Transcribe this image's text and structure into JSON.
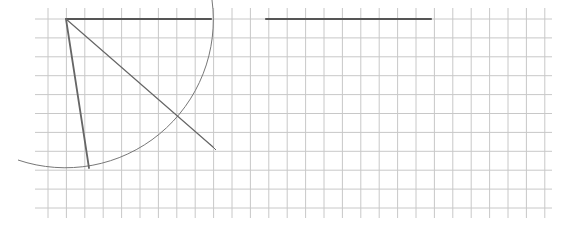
{
  "figure": {
    "caption_fragment": "... ∠ ... 2",
    "background": "#ffffff",
    "grid": {
      "color": "#c8c8c8",
      "cell_size_px": 18.4,
      "x_start": 48,
      "y_start": 19,
      "columns": 28,
      "rows": 11,
      "left_edge": 35,
      "right_edge": 552,
      "top_edge": 8,
      "bottom_edge": 218
    },
    "segments": [
      {
        "name": "top-segment-ab",
        "x1": 66,
        "y1": 19,
        "x2": 211,
        "y2": 19,
        "color": "#555555",
        "width": 2.2
      },
      {
        "name": "reference-segment",
        "x1": 266,
        "y1": 19,
        "x2": 431,
        "y2": 19,
        "color": "#555555",
        "width": 2.2
      },
      {
        "name": "steep-segment",
        "x1": 66,
        "y1": 19,
        "x2": 89,
        "y2": 168,
        "color": "#666666",
        "width": 1.8
      },
      {
        "name": "diagonal-segment",
        "x1": 66,
        "y1": 19,
        "x2": 213,
        "y2": 147,
        "color": "#666666",
        "width": 1.2
      }
    ],
    "arc": {
      "name": "compass-arc",
      "cx": 66,
      "cy": 19,
      "r": 148,
      "start": {
        "x": 212,
        "y": 0
      },
      "end": {
        "x": 18,
        "y": 160
      },
      "color": "#777777",
      "width": 1
    },
    "markers": [
      {
        "name": "endpoint-tick",
        "x": 213,
        "y": 147
      }
    ]
  }
}
